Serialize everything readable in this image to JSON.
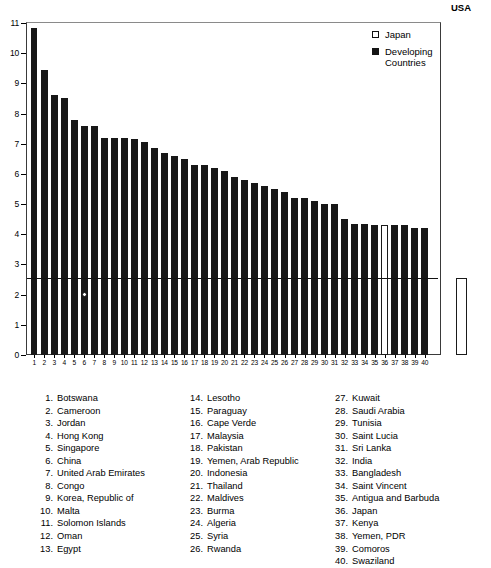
{
  "chart_data": {
    "type": "bar",
    "title": "",
    "subtitle": "",
    "xlabel": "",
    "ylabel": "",
    "ylim": [
      0,
      11
    ],
    "yticks": [
      0,
      1,
      2,
      3,
      4,
      5,
      6,
      7,
      8,
      9,
      10,
      11
    ],
    "grid": false,
    "legend_position": "top-right",
    "legend": [
      {
        "label": "Japan",
        "swatch": "open"
      },
      {
        "label": "Developing\nCountries",
        "swatch": "filled"
      }
    ],
    "reference_line": {
      "value": 2.55,
      "style": "solid"
    },
    "marker": {
      "category": "6",
      "value": 2.0,
      "style": "open-circle"
    },
    "categories": [
      "1",
      "2",
      "3",
      "4",
      "5",
      "6",
      "7",
      "8",
      "9",
      "10",
      "11",
      "12",
      "13",
      "14",
      "15",
      "16",
      "17",
      "18",
      "19",
      "20",
      "21",
      "22",
      "23",
      "24",
      "25",
      "26",
      "27",
      "28",
      "29",
      "30",
      "31",
      "32",
      "33",
      "34",
      "35",
      "36",
      "37",
      "38",
      "39",
      "40"
    ],
    "values": [
      10.85,
      9.45,
      8.6,
      8.5,
      7.8,
      7.6,
      7.6,
      7.2,
      7.2,
      7.2,
      7.15,
      7.05,
      6.85,
      6.7,
      6.6,
      6.5,
      6.3,
      6.3,
      6.2,
      6.1,
      5.9,
      5.8,
      5.7,
      5.6,
      5.5,
      5.4,
      5.2,
      5.2,
      5.1,
      5.0,
      5.0,
      4.5,
      4.35,
      4.35,
      4.3,
      4.3,
      4.3,
      4.3,
      4.2,
      4.2
    ],
    "bar_styles": [
      "filled",
      "filled",
      "filled",
      "filled",
      "filled",
      "filled",
      "filled",
      "filled",
      "filled",
      "filled",
      "filled",
      "filled",
      "filled",
      "filled",
      "filled",
      "filled",
      "filled",
      "filled",
      "filled",
      "filled",
      "filled",
      "filled",
      "filled",
      "filled",
      "filled",
      "filled",
      "filled",
      "filled",
      "filled",
      "filled",
      "filled",
      "filled",
      "filled",
      "filled",
      "filled",
      "open",
      "filled",
      "filled",
      "filled",
      "filled"
    ],
    "external_bar": {
      "label": "USA",
      "value": 2.55,
      "style": "open"
    }
  },
  "country_key": {
    "columns": [
      [
        {
          "num": "1.",
          "name": "Botswana"
        },
        {
          "num": "2.",
          "name": "Cameroon"
        },
        {
          "num": "3.",
          "name": "Jordan"
        },
        {
          "num": "4.",
          "name": "Hong Kong"
        },
        {
          "num": "5.",
          "name": "Singapore"
        },
        {
          "num": "6.",
          "name": "China"
        },
        {
          "num": "7.",
          "name": "United Arab Emirates"
        },
        {
          "num": "8.",
          "name": "Congo"
        },
        {
          "num": "9.",
          "name": "Korea, Republic of"
        },
        {
          "num": "10.",
          "name": "Malta"
        },
        {
          "num": "11.",
          "name": "Solomon Islands"
        },
        {
          "num": "12.",
          "name": "Oman"
        },
        {
          "num": "13.",
          "name": "Egypt"
        }
      ],
      [
        {
          "num": "14.",
          "name": "Lesotho"
        },
        {
          "num": "15.",
          "name": "Paraguay"
        },
        {
          "num": "16.",
          "name": "Cape Verde"
        },
        {
          "num": "17.",
          "name": "Malaysia"
        },
        {
          "num": "18.",
          "name": "Pakistan"
        },
        {
          "num": "19.",
          "name": "Yemen, Arab Republic"
        },
        {
          "num": "20.",
          "name": "Indonesia"
        },
        {
          "num": "21.",
          "name": "Thailand"
        },
        {
          "num": "22.",
          "name": "Maldives"
        },
        {
          "num": "23.",
          "name": "Burma"
        },
        {
          "num": "24.",
          "name": "Algeria"
        },
        {
          "num": "25.",
          "name": "Syria"
        },
        {
          "num": "26.",
          "name": "Rwanda"
        }
      ],
      [
        {
          "num": "27.",
          "name": "Kuwait"
        },
        {
          "num": "28.",
          "name": "Saudi Arabia"
        },
        {
          "num": "29.",
          "name": "Tunisia"
        },
        {
          "num": "30.",
          "name": "Saint Lucia"
        },
        {
          "num": "31.",
          "name": "Sri Lanka"
        },
        {
          "num": "32.",
          "name": "India"
        },
        {
          "num": "33.",
          "name": "Bangladesh"
        },
        {
          "num": "34.",
          "name": "Saint Vincent"
        },
        {
          "num": "35.",
          "name": "Antigua and Barbuda"
        },
        {
          "num": "36.",
          "name": "Japan"
        },
        {
          "num": "37.",
          "name": "Kenya"
        },
        {
          "num": "38.",
          "name": "Yemen, PDR"
        },
        {
          "num": "39.",
          "name": "Comoros"
        },
        {
          "num": "40.",
          "name": "Swaziland"
        }
      ]
    ]
  },
  "colors": {
    "bar_fill": "#171717",
    "bar_open": "#ffffff",
    "axis": "#000000",
    "background": "#ffffff"
  }
}
